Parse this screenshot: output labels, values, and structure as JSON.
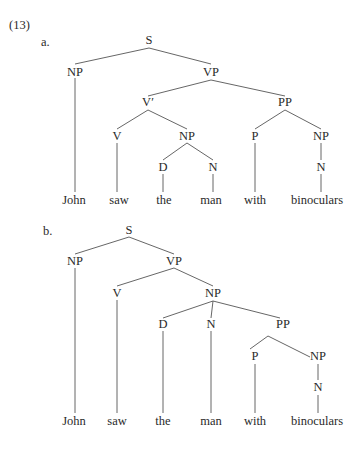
{
  "example_number": "(13)",
  "trees": [
    {
      "label": "a.",
      "label_pos": [
        41,
        46
      ],
      "nodes": [
        {
          "id": "S",
          "text": "S",
          "x": 149,
          "y": 44
        },
        {
          "id": "NP1",
          "text": "NP",
          "x": 75,
          "y": 76
        },
        {
          "id": "VP",
          "text": "VP",
          "x": 211,
          "y": 76
        },
        {
          "id": "Vbar",
          "text": "V′",
          "x": 148,
          "y": 106
        },
        {
          "id": "PP",
          "text": "PP",
          "x": 285,
          "y": 106
        },
        {
          "id": "V",
          "text": "V",
          "x": 117,
          "y": 140
        },
        {
          "id": "NP2",
          "text": "NP",
          "x": 187,
          "y": 140
        },
        {
          "id": "P",
          "text": "P",
          "x": 255,
          "y": 140
        },
        {
          "id": "NP3",
          "text": "NP",
          "x": 321,
          "y": 140
        },
        {
          "id": "D",
          "text": "D",
          "x": 163,
          "y": 171
        },
        {
          "id": "N1",
          "text": "N",
          "x": 213,
          "y": 171
        },
        {
          "id": "N2",
          "text": "N",
          "x": 321,
          "y": 171
        },
        {
          "id": "w1",
          "text": "John",
          "x": 74,
          "y": 204
        },
        {
          "id": "w2",
          "text": "saw",
          "x": 119,
          "y": 204
        },
        {
          "id": "w3",
          "text": "the",
          "x": 164,
          "y": 204
        },
        {
          "id": "w4",
          "text": "man",
          "x": 211,
          "y": 204
        },
        {
          "id": "w5",
          "text": "with",
          "x": 255,
          "y": 204
        },
        {
          "id": "w6",
          "text": "binoculars",
          "x": 317,
          "y": 204
        }
      ],
      "edges": [
        [
          149,
          48,
          75,
          64
        ],
        [
          149,
          48,
          211,
          64
        ],
        [
          75,
          78,
          75,
          192
        ],
        [
          211,
          80,
          148,
          96
        ],
        [
          211,
          80,
          285,
          96
        ],
        [
          148,
          110,
          117,
          129
        ],
        [
          148,
          110,
          187,
          129
        ],
        [
          285,
          110,
          255,
          129
        ],
        [
          285,
          110,
          321,
          129
        ],
        [
          117,
          143,
          117,
          192
        ],
        [
          187,
          143,
          163,
          160
        ],
        [
          187,
          143,
          213,
          160
        ],
        [
          163,
          174,
          163,
          192
        ],
        [
          213,
          174,
          213,
          192
        ],
        [
          255,
          143,
          255,
          192
        ],
        [
          321,
          143,
          321,
          160
        ],
        [
          321,
          174,
          321,
          192
        ]
      ]
    },
    {
      "label": "b.",
      "label_pos": [
        43,
        235
      ],
      "nodes": [
        {
          "id": "S",
          "text": "S",
          "x": 129,
          "y": 234
        },
        {
          "id": "NP1",
          "text": "NP",
          "x": 75,
          "y": 265
        },
        {
          "id": "VP",
          "text": "VP",
          "x": 174,
          "y": 265
        },
        {
          "id": "V",
          "text": "V",
          "x": 117,
          "y": 297
        },
        {
          "id": "NP2",
          "text": "NP",
          "x": 213,
          "y": 297
        },
        {
          "id": "D",
          "text": "D",
          "x": 163,
          "y": 328
        },
        {
          "id": "N1",
          "text": "N",
          "x": 211,
          "y": 328
        },
        {
          "id": "PP",
          "text": "PP",
          "x": 283,
          "y": 328
        },
        {
          "id": "P",
          "text": "P",
          "x": 255,
          "y": 360
        },
        {
          "id": "NP3",
          "text": "NP",
          "x": 318,
          "y": 360
        },
        {
          "id": "N2",
          "text": "N",
          "x": 318,
          "y": 391
        },
        {
          "id": "w1",
          "text": "John",
          "x": 74,
          "y": 425
        },
        {
          "id": "w2",
          "text": "saw",
          "x": 117,
          "y": 425
        },
        {
          "id": "w3",
          "text": "the",
          "x": 163,
          "y": 425
        },
        {
          "id": "w4",
          "text": "man",
          "x": 211,
          "y": 425
        },
        {
          "id": "w5",
          "text": "with",
          "x": 255,
          "y": 425
        },
        {
          "id": "w6",
          "text": "binoculars",
          "x": 317,
          "y": 425
        }
      ],
      "edges": [
        [
          129,
          237,
          75,
          254
        ],
        [
          129,
          237,
          174,
          254
        ],
        [
          75,
          268,
          75,
          413
        ],
        [
          174,
          268,
          117,
          286
        ],
        [
          174,
          268,
          213,
          286
        ],
        [
          117,
          300,
          117,
          413
        ],
        [
          213,
          301,
          163,
          318
        ],
        [
          213,
          301,
          211,
          318
        ],
        [
          213,
          301,
          280,
          318
        ],
        [
          163,
          331,
          163,
          413
        ],
        [
          211,
          331,
          211,
          413
        ],
        [
          268,
          336,
          250,
          349
        ],
        [
          268,
          336,
          310,
          357
        ],
        [
          255,
          364,
          255,
          413
        ],
        [
          318,
          364,
          318,
          380
        ],
        [
          318,
          395,
          318,
          413
        ]
      ]
    }
  ]
}
